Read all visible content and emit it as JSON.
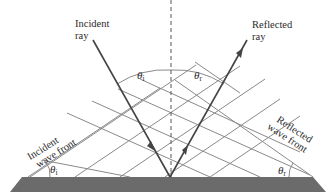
{
  "figure": {
    "labels": {
      "incident_ray": [
        "Incident",
        "ray"
      ],
      "reflected_ray": [
        "Reflected",
        "ray"
      ],
      "incident_wave_front": [
        "Incident",
        "wave front"
      ],
      "reflected_wave_front": [
        "Reflected",
        "wave front"
      ],
      "theta_symbol": "θ",
      "incident_subscript": "i",
      "reflected_subscript": "r"
    },
    "colors": {
      "ray": "#444444",
      "wave_front": "#8a8a8a",
      "normal": "#555555",
      "surface": "#6b6b6b",
      "text": "#2a2a2a"
    },
    "geometry": {
      "point_of_incidence": [
        170,
        177
      ],
      "normal_line": "dashed vertical",
      "angle_of_incidence_equals_angle_of_reflection": true
    }
  }
}
